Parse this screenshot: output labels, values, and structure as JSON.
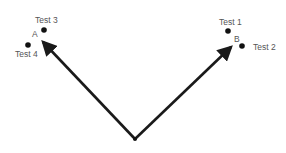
{
  "diagram": {
    "origin": {
      "x": 135,
      "y": 139
    },
    "arrows": [
      {
        "id": "A",
        "label": "A",
        "tip": {
          "x": 39,
          "y": 38
        },
        "label_pos": {
          "x": 35,
          "y": 37
        }
      },
      {
        "id": "B",
        "label": "B",
        "tip": {
          "x": 235,
          "y": 43
        },
        "label_pos": {
          "x": 237,
          "y": 42
        }
      }
    ],
    "points": [
      {
        "label": "Test 1",
        "x": 228,
        "y": 31
      },
      {
        "label": "Test 2",
        "x": 242,
        "y": 46
      },
      {
        "label": "Test 3",
        "x": 44,
        "y": 30
      },
      {
        "label": "Test 4",
        "x": 28,
        "y": 45
      }
    ],
    "colors": {
      "arrow": "#1a1a1a",
      "point": "#111111",
      "text": "#555555",
      "background": "#ffffff"
    }
  }
}
